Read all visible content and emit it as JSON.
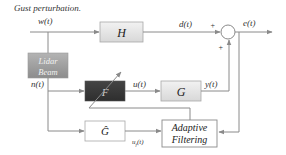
{
  "diagram": {
    "title_label": "Gust perturbation.",
    "signals": {
      "w": "w(t)",
      "d": "d(t)",
      "e": "e(t)",
      "n": "n(t)",
      "u": "u(t)",
      "y": "y(t)",
      "uf": "u",
      "uf_sub": "f",
      "uf_arg": "(t)"
    },
    "blocks": {
      "H": "H",
      "lidar_line1": "Lidar",
      "lidar_line2": "Beam",
      "F": "F",
      "G": "G",
      "G_hat": "Ĝ",
      "adaptive_line1": "Adaptive",
      "adaptive_line2": "Filtering"
    },
    "sum_signs": {
      "top": "+",
      "bottom": "+"
    },
    "colors": {
      "line": "#8a8a8a",
      "block_light": "#e6e6e6",
      "block_dark": "#3a3a3a",
      "lidar": "#9a9a9a"
    }
  }
}
